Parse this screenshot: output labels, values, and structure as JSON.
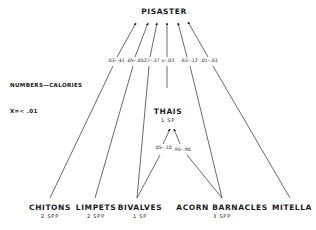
{
  "diagram": {
    "type": "food-web",
    "legend": {
      "title": "NUMBERS—CALORIES",
      "note": "X=< .01"
    },
    "nodes": {
      "pisaster": {
        "name": "PISASTER",
        "spp": ""
      },
      "thais": {
        "name": "THAIS",
        "spp": "1 SP"
      },
      "chitons": {
        "name": "CHITONS",
        "spp": "2 SPP"
      },
      "limpets": {
        "name": "LIMPETS",
        "spp": "2 SPP"
      },
      "bivalves": {
        "name": "BIVALVES",
        "spp": "1 SP"
      },
      "acorn_barnacles": {
        "name": "ACORN BARNACLES",
        "spp": "3 SPP"
      },
      "mitella": {
        "name": "MITELLA",
        "spp": ""
      }
    },
    "edges": [
      {
        "from": "CHITONS",
        "to": "PISASTER",
        "label": ".03–.41"
      },
      {
        "from": "LIMPETS",
        "to": "PISASTER",
        "label": ".05–.05"
      },
      {
        "from": "BIVALVES",
        "to": "PISASTER",
        "label": ".27–.37"
      },
      {
        "from": "THAIS",
        "to": "PISASTER",
        "label": "x–.02"
      },
      {
        "from": "ACORN BARNACLES",
        "to": "PISASTER",
        "label": ".63–.12"
      },
      {
        "from": "MITELLA",
        "to": "PISASTER",
        "label": ".01–.03"
      },
      {
        "from": "BIVALVES",
        "to": "THAIS",
        "label": ".05–.10"
      },
      {
        "from": "ACORN BARNACLES",
        "to": "THAIS",
        "label": ".95–.90"
      }
    ]
  }
}
